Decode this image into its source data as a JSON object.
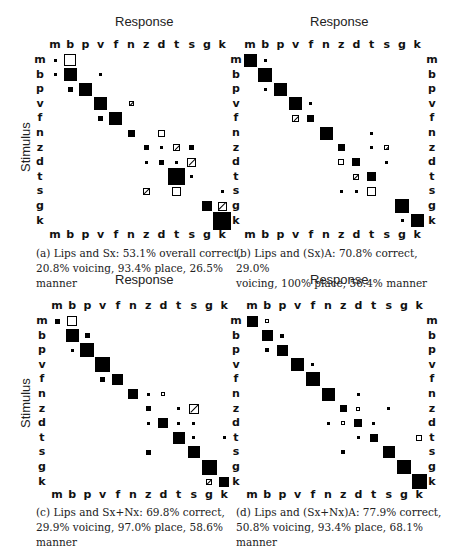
{
  "chart_data": [
    {
      "type": "heatmap",
      "id": "a",
      "title": "Response",
      "xlabel": "Response",
      "ylabel": "Stimulus",
      "categories": [
        "m",
        "b",
        "p",
        "v",
        "f",
        "n",
        "z",
        "d",
        "t",
        "s",
        "g",
        "k"
      ],
      "caption": "(a) Lips and Sx: 53.1% overall correct, 20.8% voicing, 93.4% place, 26.5% manner",
      "caption_lines": [
        "(a) Lips and Sx: 53.1% overall correct,",
        "20.8% voicing, 93.4% place, 26.5%",
        "manner"
      ],
      "cells": [
        {
          "r": "m",
          "c": "m",
          "s": 3,
          "t": "fill"
        },
        {
          "r": "m",
          "c": "b",
          "s": 12,
          "t": "open"
        },
        {
          "r": "b",
          "c": "m",
          "s": 3,
          "t": "fill"
        },
        {
          "r": "b",
          "c": "b",
          "s": 13,
          "t": "fill"
        },
        {
          "r": "b",
          "c": "v",
          "s": 3,
          "t": "fill"
        },
        {
          "r": "p",
          "c": "b",
          "s": 5,
          "t": "fill"
        },
        {
          "r": "p",
          "c": "p",
          "s": 13,
          "t": "fill"
        },
        {
          "r": "v",
          "c": "v",
          "s": 13,
          "t": "fill"
        },
        {
          "r": "v",
          "c": "n",
          "s": 5,
          "t": "hatch"
        },
        {
          "r": "f",
          "c": "v",
          "s": 5,
          "t": "fill"
        },
        {
          "r": "f",
          "c": "f",
          "s": 13,
          "t": "fill"
        },
        {
          "r": "n",
          "c": "n",
          "s": 7,
          "t": "fill"
        },
        {
          "r": "n",
          "c": "d",
          "s": 7,
          "t": "open"
        },
        {
          "r": "z",
          "c": "z",
          "s": 5,
          "t": "fill"
        },
        {
          "r": "z",
          "c": "d",
          "s": 3,
          "t": "fill"
        },
        {
          "r": "z",
          "c": "t",
          "s": 7,
          "t": "hatch"
        },
        {
          "r": "z",
          "c": "s",
          "s": 5,
          "t": "fill"
        },
        {
          "r": "d",
          "c": "z",
          "s": 3,
          "t": "fill"
        },
        {
          "r": "d",
          "c": "d",
          "s": 5,
          "t": "fill"
        },
        {
          "r": "d",
          "c": "t",
          "s": 3,
          "t": "fill"
        },
        {
          "r": "d",
          "c": "s",
          "s": 9,
          "t": "hatch"
        },
        {
          "r": "t",
          "c": "t",
          "s": 17,
          "t": "fill"
        },
        {
          "r": "t",
          "c": "s",
          "s": 3,
          "t": "fill"
        },
        {
          "r": "s",
          "c": "z",
          "s": 7,
          "t": "hatch"
        },
        {
          "r": "s",
          "c": "t",
          "s": 9,
          "t": "open"
        },
        {
          "r": "s",
          "c": "k",
          "s": 3,
          "t": "fill"
        },
        {
          "r": "g",
          "c": "g",
          "s": 10,
          "t": "fill"
        },
        {
          "r": "g",
          "c": "k",
          "s": 9,
          "t": "hatch"
        },
        {
          "r": "k",
          "c": "k",
          "s": 18,
          "t": "fill"
        }
      ],
      "metrics": {
        "overall_correct": 53.1,
        "voicing": 20.8,
        "place": 93.4,
        "manner": 26.5
      }
    },
    {
      "type": "heatmap",
      "id": "b",
      "title": "Response",
      "xlabel": "Response",
      "ylabel": "",
      "categories": [
        "m",
        "b",
        "p",
        "v",
        "f",
        "n",
        "z",
        "d",
        "t",
        "s",
        "g",
        "k"
      ],
      "caption": "(b) Lips and (Sx)A: 70.8% correct, 29.0% voicing, 100% place, 56.4% manner",
      "caption_lines": [
        "(b) Lips and (Sx)A: 70.8% correct, 29.0%",
        "voicing, 100% place, 56.4% manner"
      ],
      "cells": [
        {
          "r": "m",
          "c": "m",
          "s": 13,
          "t": "fill"
        },
        {
          "r": "m",
          "c": "b",
          "s": 3,
          "t": "fill"
        },
        {
          "r": "b",
          "c": "b",
          "s": 14,
          "t": "fill"
        },
        {
          "r": "p",
          "c": "b",
          "s": 3,
          "t": "fill"
        },
        {
          "r": "p",
          "c": "p",
          "s": 13,
          "t": "fill"
        },
        {
          "r": "v",
          "c": "v",
          "s": 13,
          "t": "fill"
        },
        {
          "r": "v",
          "c": "f",
          "s": 3,
          "t": "fill"
        },
        {
          "r": "f",
          "c": "v",
          "s": 7,
          "t": "hatch"
        },
        {
          "r": "f",
          "c": "f",
          "s": 7,
          "t": "fill"
        },
        {
          "r": "n",
          "c": "n",
          "s": 13,
          "t": "fill"
        },
        {
          "r": "n",
          "c": "t",
          "s": 3,
          "t": "fill"
        },
        {
          "r": "z",
          "c": "z",
          "s": 7,
          "t": "fill"
        },
        {
          "r": "z",
          "c": "t",
          "s": 3,
          "t": "fill"
        },
        {
          "r": "z",
          "c": "s",
          "s": 5,
          "t": "hatch"
        },
        {
          "r": "d",
          "c": "z",
          "s": 6,
          "t": "open"
        },
        {
          "r": "d",
          "c": "d",
          "s": 8,
          "t": "fill"
        },
        {
          "r": "d",
          "c": "s",
          "s": 3,
          "t": "fill"
        },
        {
          "r": "t",
          "c": "d",
          "s": 6,
          "t": "hatch"
        },
        {
          "r": "t",
          "c": "t",
          "s": 9,
          "t": "fill"
        },
        {
          "r": "s",
          "c": "z",
          "s": 3,
          "t": "fill"
        },
        {
          "r": "s",
          "c": "d",
          "s": 3,
          "t": "fill"
        },
        {
          "r": "s",
          "c": "t",
          "s": 9,
          "t": "open"
        },
        {
          "r": "g",
          "c": "g",
          "s": 14,
          "t": "fill"
        },
        {
          "r": "k",
          "c": "g",
          "s": 3,
          "t": "fill"
        },
        {
          "r": "k",
          "c": "k",
          "s": 13,
          "t": "fill"
        }
      ],
      "metrics": {
        "overall_correct": 70.8,
        "voicing": 29.0,
        "place": 100,
        "manner": 56.4
      }
    },
    {
      "type": "heatmap",
      "id": "c",
      "title": "Response",
      "xlabel": "Response",
      "ylabel": "Stimulus",
      "categories": [
        "m",
        "b",
        "p",
        "v",
        "f",
        "n",
        "z",
        "d",
        "t",
        "s",
        "g",
        "k"
      ],
      "caption": "(c) Lips and Sx+Nx: 69.8% correct, 29.9% voicing, 97.0% place, 58.6% manner",
      "caption_lines": [
        "(c) Lips and Sx+Nx: 69.8% correct,",
        "29.9% voicing, 97.0% place, 58.6%",
        "manner"
      ],
      "cells": [
        {
          "r": "m",
          "c": "m",
          "s": 5,
          "t": "fill"
        },
        {
          "r": "m",
          "c": "b",
          "s": 10,
          "t": "open"
        },
        {
          "r": "b",
          "c": "b",
          "s": 13,
          "t": "fill"
        },
        {
          "r": "b",
          "c": "p",
          "s": 5,
          "t": "fill"
        },
        {
          "r": "p",
          "c": "b",
          "s": 3,
          "t": "fill"
        },
        {
          "r": "p",
          "c": "p",
          "s": 14,
          "t": "fill"
        },
        {
          "r": "v",
          "c": "v",
          "s": 15,
          "t": "fill"
        },
        {
          "r": "f",
          "c": "v",
          "s": 5,
          "t": "fill"
        },
        {
          "r": "f",
          "c": "f",
          "s": 11,
          "t": "fill"
        },
        {
          "r": "n",
          "c": "n",
          "s": 10,
          "t": "fill"
        },
        {
          "r": "n",
          "c": "z",
          "s": 3,
          "t": "fill"
        },
        {
          "r": "n",
          "c": "d",
          "s": 4,
          "t": "open"
        },
        {
          "r": "z",
          "c": "z",
          "s": 5,
          "t": "fill"
        },
        {
          "r": "z",
          "c": "t",
          "s": 3,
          "t": "fill"
        },
        {
          "r": "z",
          "c": "s",
          "s": 10,
          "t": "hatch"
        },
        {
          "r": "d",
          "c": "z",
          "s": 3,
          "t": "fill"
        },
        {
          "r": "d",
          "c": "d",
          "s": 10,
          "t": "fill"
        },
        {
          "r": "d",
          "c": "t",
          "s": 3,
          "t": "fill"
        },
        {
          "r": "d",
          "c": "s",
          "s": 3,
          "t": "fill"
        },
        {
          "r": "t",
          "c": "t",
          "s": 12,
          "t": "fill"
        },
        {
          "r": "t",
          "c": "s",
          "s": 3,
          "t": "fill"
        },
        {
          "r": "t",
          "c": "k",
          "s": 3,
          "t": "fill"
        },
        {
          "r": "s",
          "c": "z",
          "s": 5,
          "t": "fill"
        },
        {
          "r": "s",
          "c": "s",
          "s": 12,
          "t": "fill"
        },
        {
          "r": "g",
          "c": "g",
          "s": 15,
          "t": "fill"
        },
        {
          "r": "k",
          "c": "g",
          "s": 6,
          "t": "hatch"
        },
        {
          "r": "k",
          "c": "k",
          "s": 10,
          "t": "fill"
        }
      ],
      "metrics": {
        "overall_correct": 69.8,
        "voicing": 29.9,
        "place": 97.0,
        "manner": 58.6
      }
    },
    {
      "type": "heatmap",
      "id": "d",
      "title": "Response",
      "xlabel": "Response",
      "ylabel": "",
      "categories": [
        "m",
        "b",
        "p",
        "v",
        "f",
        "n",
        "z",
        "d",
        "t",
        "s",
        "g",
        "k"
      ],
      "caption": "(d) Lips and (Sx+Nx)A: 77.9% correct, 50.8% voicing, 93.4% place, 68.1% manner",
      "caption_lines": [
        "(d) Lips and (Sx+Nx)A: 77.9% correct,",
        "50.8% voicing, 93.4% place, 68.1%",
        "manner"
      ],
      "cells": [
        {
          "r": "m",
          "c": "m",
          "s": 11,
          "t": "fill"
        },
        {
          "r": "m",
          "c": "b",
          "s": 4,
          "t": "open"
        },
        {
          "r": "b",
          "c": "b",
          "s": 11,
          "t": "fill"
        },
        {
          "r": "b",
          "c": "p",
          "s": 4,
          "t": "fill"
        },
        {
          "r": "p",
          "c": "b",
          "s": 4,
          "t": "fill"
        },
        {
          "r": "p",
          "c": "p",
          "s": 11,
          "t": "fill"
        },
        {
          "r": "v",
          "c": "v",
          "s": 13,
          "t": "fill"
        },
        {
          "r": "v",
          "c": "f",
          "s": 3,
          "t": "fill"
        },
        {
          "r": "f",
          "c": "f",
          "s": 14,
          "t": "fill"
        },
        {
          "r": "n",
          "c": "n",
          "s": 13,
          "t": "fill"
        },
        {
          "r": "n",
          "c": "d",
          "s": 3,
          "t": "fill"
        },
        {
          "r": "z",
          "c": "z",
          "s": 7,
          "t": "fill"
        },
        {
          "r": "z",
          "c": "d",
          "s": 4,
          "t": "open"
        },
        {
          "r": "z",
          "c": "s",
          "s": 3,
          "t": "fill"
        },
        {
          "r": "d",
          "c": "n",
          "s": 3,
          "t": "fill"
        },
        {
          "r": "d",
          "c": "z",
          "s": 4,
          "t": "open"
        },
        {
          "r": "d",
          "c": "d",
          "s": 8,
          "t": "fill"
        },
        {
          "r": "d",
          "c": "t",
          "s": 3,
          "t": "fill"
        },
        {
          "r": "t",
          "c": "d",
          "s": 3,
          "t": "fill"
        },
        {
          "r": "t",
          "c": "t",
          "s": 8,
          "t": "fill"
        },
        {
          "r": "t",
          "c": "k",
          "s": 6,
          "t": "open"
        },
        {
          "r": "s",
          "c": "z",
          "s": 4,
          "t": "fill"
        },
        {
          "r": "s",
          "c": "s",
          "s": 12,
          "t": "fill"
        },
        {
          "r": "g",
          "c": "g",
          "s": 14,
          "t": "fill"
        },
        {
          "r": "k",
          "c": "k",
          "s": 15,
          "t": "fill"
        }
      ],
      "metrics": {
        "overall_correct": 77.9,
        "voicing": 50.8,
        "place": 93.4,
        "manner": 68.1
      }
    }
  ],
  "labels": {
    "response": "Response",
    "stimulus": "Stimulus"
  },
  "layout": [
    {
      "id": "a",
      "col0": 55,
      "colStep": 15.2,
      "row0": 60,
      "rowStep": 14.6,
      "rowLabelX": 33,
      "rightLabels": false,
      "respX": 115,
      "respY": 14,
      "topLblY": 39,
      "botLblY": 229,
      "stimX": 18,
      "stimY": 172,
      "capX": 36,
      "capY": 246
    },
    {
      "id": "b",
      "col0": 250,
      "colStep": 15.2,
      "row0": 60,
      "rowStep": 14.6,
      "rowLabelX": 229,
      "rightLabels": true,
      "rightLabelX": 425,
      "respX": 310,
      "respY": 14,
      "topLblY": 39,
      "botLblY": 229,
      "stimX": null,
      "stimY": null,
      "capX": 236,
      "capY": 246
    },
    {
      "id": "c",
      "col0": 57,
      "colStep": 15.2,
      "row0": 321,
      "rowStep": 14.6,
      "rowLabelX": 35,
      "rightLabels": false,
      "respX": 115,
      "respY": 272,
      "topLblY": 300,
      "botLblY": 489,
      "stimX": 18,
      "stimY": 428,
      "capX": 36,
      "capY": 505
    },
    {
      "id": "d",
      "col0": 252,
      "colStep": 15.2,
      "row0": 321,
      "rowStep": 14.6,
      "rowLabelX": 229,
      "rightLabels": true,
      "rightLabelX": 425,
      "respX": 310,
      "respY": 272,
      "topLblY": 300,
      "botLblY": 489,
      "stimX": null,
      "stimY": null,
      "capX": 236,
      "capY": 505
    }
  ]
}
